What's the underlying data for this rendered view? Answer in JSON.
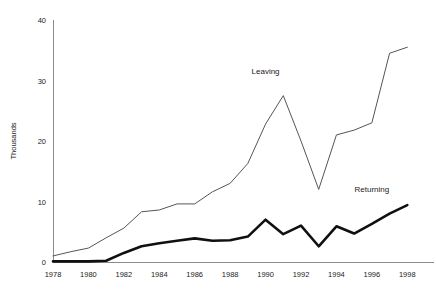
{
  "chart_data": {
    "type": "line",
    "title": "",
    "subtitle": "",
    "xlabel": "",
    "ylabel": "Thousands",
    "xlim": [
      1978,
      1999
    ],
    "ylim": [
      0,
      40
    ],
    "grid": false,
    "legend_position": "inline-annotations",
    "x_tick_labels": [
      "1978",
      "1980",
      "1982",
      "1984",
      "1986",
      "1988",
      "1990",
      "1992",
      "1994",
      "1996",
      "1998"
    ],
    "x_tick_values": [
      1978,
      1980,
      1982,
      1984,
      1986,
      1988,
      1990,
      1992,
      1994,
      1996,
      1998
    ],
    "y_tick_labels": [
      "0",
      "10",
      "20",
      "30",
      "40"
    ],
    "y_tick_values": [
      0,
      10,
      20,
      30,
      40
    ],
    "x": [
      1978,
      1979,
      1980,
      1981,
      1982,
      1983,
      1984,
      1985,
      1986,
      1987,
      1988,
      1989,
      1990,
      1991,
      1992,
      1993,
      1994,
      1995,
      1996,
      1997,
      1998
    ],
    "series": [
      {
        "name": "Leaving",
        "color": "#555555",
        "values": [
          1.0,
          1.7,
          2.3,
          4.0,
          5.6,
          8.3,
          8.6,
          9.6,
          9.6,
          11.6,
          13.0,
          16.3,
          22.8,
          27.5,
          20.0,
          12.0,
          21.0,
          21.8,
          23.0,
          34.5,
          35.5
        ],
        "annotation": {
          "text": "Leaving",
          "at_x": 1990,
          "at_y": 31.0
        }
      },
      {
        "name": "Returning",
        "color": "#101010",
        "values": [
          0.1,
          0.1,
          0.1,
          0.2,
          1.5,
          2.6,
          3.1,
          3.5,
          3.9,
          3.5,
          3.6,
          4.2,
          7.0,
          4.6,
          6.0,
          2.6,
          5.9,
          4.7,
          6.3,
          8.0,
          9.4
        ],
        "annotation": {
          "text": "Returning",
          "at_x": 1996,
          "at_y": 11.5
        }
      }
    ]
  }
}
